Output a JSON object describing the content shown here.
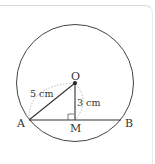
{
  "diagram": {
    "points": {
      "O": "O",
      "A": "A",
      "B": "B",
      "M": "M"
    },
    "labels": {
      "AO": "5 cm",
      "OM": "3 cm"
    },
    "colors": {
      "line": "#333333",
      "dashed": "#aaaaaa",
      "frame": "#d8d8d8"
    }
  }
}
